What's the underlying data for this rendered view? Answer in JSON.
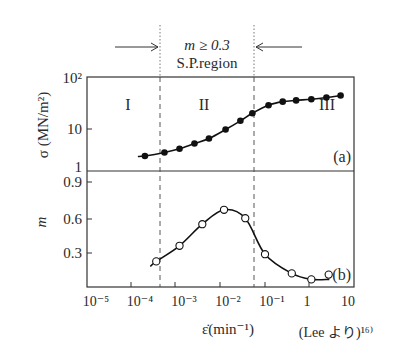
{
  "chart_data": [
    {
      "panel": "(a)",
      "type": "line",
      "marker": "filled-circle",
      "ylabel": "σ (MN/m²)",
      "yscale": "log",
      "ylim": [
        1,
        100
      ],
      "yticks": [
        "1",
        "10",
        "10²"
      ],
      "xscale": "log",
      "xlim": [
        1e-05,
        10
      ],
      "region_labels": [
        "I",
        "II",
        "III"
      ],
      "points": [
        {
          "x": 0.0002,
          "y": 2.1
        },
        {
          "x": 0.00055,
          "y": 2.5
        },
        {
          "x": 0.0012,
          "y": 3.0
        },
        {
          "x": 0.0026,
          "y": 3.9
        },
        {
          "x": 0.0055,
          "y": 5.0
        },
        {
          "x": 0.013,
          "y": 7.8
        },
        {
          "x": 0.028,
          "y": 12.0
        },
        {
          "x": 0.052,
          "y": 17.5
        },
        {
          "x": 0.12,
          "y": 26
        },
        {
          "x": 0.25,
          "y": 31
        },
        {
          "x": 0.5,
          "y": 33
        },
        {
          "x": 1.1,
          "y": 35
        },
        {
          "x": 2.4,
          "y": 38
        },
        {
          "x": 5.0,
          "y": 42
        }
      ]
    },
    {
      "panel": "(b)",
      "type": "line",
      "marker": "open-circle",
      "ylabel": "m",
      "yscale": "linear",
      "ylim": [
        0,
        0.95
      ],
      "yticks": [
        "0.3",
        "0.6",
        "0.9"
      ],
      "xscale": "log",
      "xlim": [
        1e-05,
        10
      ],
      "points": [
        {
          "x": 0.00036,
          "y": 0.23
        },
        {
          "x": 0.0012,
          "y": 0.36
        },
        {
          "x": 0.0039,
          "y": 0.54
        },
        {
          "x": 0.012,
          "y": 0.66
        },
        {
          "x": 0.036,
          "y": 0.59
        },
        {
          "x": 0.1,
          "y": 0.29
        },
        {
          "x": 0.4,
          "y": 0.13
        },
        {
          "x": 1.1,
          "y": 0.08
        },
        {
          "x": 2.7,
          "y": 0.12
        }
      ]
    }
  ],
  "labels": {
    "top_annotation_line1": "m ≥ 0.3",
    "top_annotation_line2": "S.P.region",
    "panel_a": "(a)",
    "panel_b": "(b)",
    "region_1": "I",
    "region_2": "II",
    "region_3": "III",
    "y_a_label": "σ (MN/m²)",
    "y_b_label": "m",
    "x_label": "ε̇(min⁻¹)",
    "source": "(Lee より)¹⁶⁾",
    "x_ticks": [
      "10⁻⁵",
      "10⁻⁴",
      "10⁻³",
      "10⁻²",
      "10⁻¹",
      "1",
      "10"
    ],
    "y_a_ticks": [
      "1",
      "10",
      "10²"
    ],
    "y_b_ticks": [
      "0.3",
      "0.6",
      "0.9"
    ]
  },
  "sp_region_bounds": {
    "low": 0.0004,
    "high": 0.07
  }
}
